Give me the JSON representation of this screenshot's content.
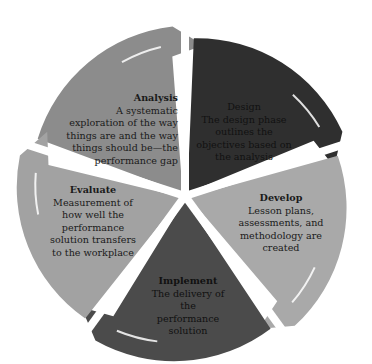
{
  "diagram": {
    "type": "cycle",
    "stages": [
      {
        "id": "analysis",
        "title": "Analysis",
        "desc": "A systematic exploration of the way things are and the way things should be—the performance gap",
        "color": "#8c8c8c"
      },
      {
        "id": "design",
        "title": "Design",
        "desc": "The design phase outlines the objectives based on the analysis",
        "color": "#2f2f2f"
      },
      {
        "id": "develop",
        "title": "Develop",
        "desc": "Lesson plans, assessments, and methodology are created",
        "color": "#a9a9a9"
      },
      {
        "id": "implement",
        "title": "Implement",
        "desc": "The delivery of the performance solution",
        "color": "#4b4b4b"
      },
      {
        "id": "evaluate",
        "title": "Evaluate",
        "desc": "Measurement of how well the performance solution transfers to the workplace",
        "color": "#a2a2a2"
      }
    ]
  }
}
